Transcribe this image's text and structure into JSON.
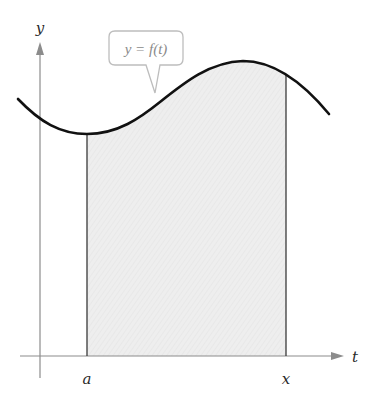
{
  "diagram": {
    "type": "area-under-curve",
    "axes": {
      "x_label": "t",
      "y_label": "y"
    },
    "function_label": "y = f(t)",
    "bounds": {
      "lower_label": "a",
      "upper_label": "x"
    },
    "colors": {
      "curve": "#111111",
      "axes": "#8c8c8c",
      "shaded_region": "#ececec",
      "bound_lines": "#3a3a3a",
      "callout_border": "#bdbdbd",
      "callout_text": "#8a8a8a"
    }
  }
}
